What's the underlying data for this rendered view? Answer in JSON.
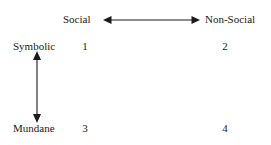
{
  "diagram": {
    "type": "2x2-matrix",
    "background_color": "#ffffff",
    "line_color": "#1a1a1a",
    "horizontal_axis": {
      "left_label": "Social",
      "right_label": "Non-Social",
      "arrow_style": "double-headed",
      "arrow_name": "horizontal-double-arrow"
    },
    "vertical_axis": {
      "top_label": "Symbolic",
      "bottom_label": "Mundane",
      "arrow_style": "double-headed",
      "arrow_name": "vertical-double-arrow"
    },
    "quadrants": [
      {
        "id": "1",
        "label": "1",
        "row": "Symbolic",
        "column": "Social"
      },
      {
        "id": "2",
        "label": "2",
        "row": "Symbolic",
        "column": "Non-Social"
      },
      {
        "id": "3",
        "label": "3",
        "row": "Mundane",
        "column": "Social"
      },
      {
        "id": "4",
        "label": "4",
        "row": "Mundane",
        "column": "Non-Social"
      }
    ]
  }
}
